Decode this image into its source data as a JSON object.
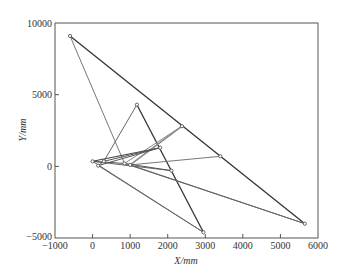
{
  "chart_data": {
    "type": "line",
    "title": "",
    "xlabel": "X/mm",
    "ylabel": "Y/mm",
    "xlim": [
      -1000,
      6000
    ],
    "ylim": [
      -5000,
      10000
    ],
    "xticks": [
      -1000,
      0,
      1000,
      2000,
      3000,
      4000,
      5000,
      6000
    ],
    "yticks": [
      -5000,
      0,
      5000,
      10000
    ],
    "grid": false,
    "legend": null,
    "nodes": {
      "A": [
        -600,
        9100
      ],
      "B": [
        5650,
        -4000
      ],
      "C": [
        2950,
        -4600
      ],
      "D": [
        1180,
        4300
      ],
      "E": [
        2380,
        2800
      ],
      "F": [
        3400,
        700
      ],
      "G": [
        1800,
        1300
      ],
      "H": [
        2100,
        -300
      ],
      "I": [
        0,
        350
      ],
      "J": [
        150,
        50
      ],
      "K": [
        850,
        200
      ],
      "L": [
        1000,
        100
      ],
      "M": [
        300,
        350
      ]
    },
    "segments": [
      {
        "from": "A",
        "to": "B",
        "color": "#333333",
        "width": 1.3
      },
      {
        "from": "A",
        "to": "K",
        "color": "#777777",
        "width": 1.0
      },
      {
        "from": "D",
        "to": "C",
        "color": "#333333",
        "width": 1.3
      },
      {
        "from": "D",
        "to": "M",
        "color": "#666666",
        "width": 1.0
      },
      {
        "from": "E",
        "to": "L",
        "color": "#888888",
        "width": 1.6
      },
      {
        "from": "E",
        "to": "K",
        "color": "#888888",
        "width": 1.0
      },
      {
        "from": "F",
        "to": "L",
        "color": "#777777",
        "width": 1.0
      },
      {
        "from": "G",
        "to": "I",
        "color": "#444444",
        "width": 1.1
      },
      {
        "from": "G",
        "to": "J",
        "color": "#555555",
        "width": 1.0
      },
      {
        "from": "H",
        "to": "I",
        "color": "#666666",
        "width": 1.0
      },
      {
        "from": "H",
        "to": "K",
        "color": "#555555",
        "width": 1.0
      },
      {
        "from": "I",
        "to": "C",
        "color": "#666666",
        "width": 1.0
      },
      {
        "from": "J",
        "to": "C",
        "color": "#666666",
        "width": 1.0
      },
      {
        "from": "K",
        "to": "B",
        "color": "#666666",
        "width": 1.0
      },
      {
        "from": "L",
        "to": "B",
        "color": "#666666",
        "width": 1.0
      },
      {
        "from": "I",
        "to": "K",
        "color": "#555555",
        "width": 1.0
      },
      {
        "from": "M",
        "to": "G",
        "color": "#555555",
        "width": 1.0
      },
      {
        "from": "J",
        "to": "M",
        "color": "#555555",
        "width": 1.0
      }
    ]
  },
  "axes": {
    "x_label": "X/mm",
    "y_label": "Y/mm"
  }
}
